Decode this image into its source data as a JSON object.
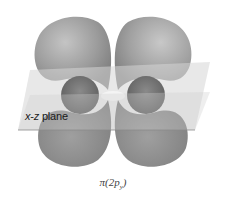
{
  "diagram": {
    "plane_label": {
      "axis1": "x",
      "separator": "-",
      "axis2": "z",
      "word": " plane"
    },
    "caption": {
      "prefix": "π(2p",
      "subscript": "y",
      "suffix": ")"
    },
    "colors": {
      "lobe": "#9a9a9a",
      "lobe_dark": "#6e6e6e",
      "plane": "#d9d9d9",
      "node_highlight": "#f2f2f2",
      "text": "#1a1a1a"
    },
    "lobes": [
      "upper-left",
      "upper-right",
      "lower-left",
      "lower-right"
    ]
  }
}
